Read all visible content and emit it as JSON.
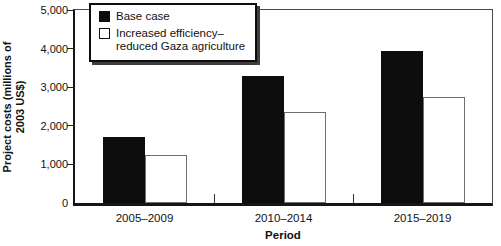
{
  "figure": {
    "y_axis_title_line1": "Project costs (millions of",
    "y_axis_title_line2": "2003 US$)",
    "x_axis_title": "Period"
  },
  "legend": {
    "items": [
      {
        "swatch_color": "#0d0d0d",
        "lines": [
          "Base case"
        ]
      },
      {
        "swatch_color": "#ffffff",
        "lines": [
          "Increased efficiency–",
          "reduced Gaza agriculture"
        ]
      }
    ]
  },
  "chart_data": {
    "type": "bar",
    "categories": [
      "2005–2009",
      "2010–2014",
      "2015–2019"
    ],
    "series": [
      {
        "name": "Base case",
        "fill": "#0d0d0d",
        "edge": "#0d0d0d",
        "values": [
          1700,
          3300,
          3950
        ]
      },
      {
        "name": "Increased efficiency–reduced Gaza agriculture",
        "fill": "#ffffff",
        "edge": "#6e6e6e",
        "values": [
          1250,
          2350,
          2750
        ]
      }
    ],
    "title": "",
    "xlabel": "Period",
    "ylabel": "Project costs (millions of 2003 US$)",
    "ylim": [
      0,
      5000
    ],
    "yticks": [
      0,
      1000,
      2000,
      3000,
      4000,
      5000
    ],
    "ytick_labels": [
      "0",
      "1,000",
      "2,000",
      "3,000",
      "4,000",
      "5,000"
    ],
    "grid": false,
    "legend_position": "top-left"
  }
}
